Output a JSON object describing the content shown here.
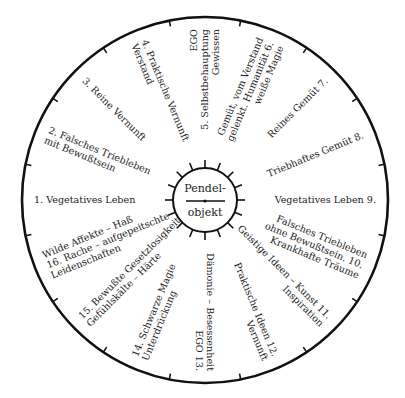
{
  "diagram": {
    "type": "radial-wheel",
    "center_label": [
      "Pendel-",
      "objekt"
    ],
    "segments": [
      {
        "num": "1.",
        "lines": [
          "1.  Vegetatives Leben"
        ],
        "angle": 180
      },
      {
        "num": "2.",
        "lines": [
          "2.  Falsches Triebleben",
          "mit Bewußtsein"
        ],
        "angle": 202.5
      },
      {
        "num": "3.",
        "lines": [
          "3.  Reine Vernunft"
        ],
        "angle": 225
      },
      {
        "num": "4.",
        "lines": [
          "4.  Praktische Vernunft",
          "Verstand"
        ],
        "angle": 247.5
      },
      {
        "num": "5.",
        "lines": [
          "EGO",
          "5.  Selbstbehauptung",
          "Gewissen"
        ],
        "angle": 270
      },
      {
        "num": "6.",
        "lines": [
          "Gemüt, vom Verstand",
          "gelenkt. Humanität  6.",
          "weiße Magie"
        ],
        "angle": 292.5
      },
      {
        "num": "7.",
        "lines": [
          "Reines Gemüt  7."
        ],
        "angle": 315
      },
      {
        "num": "8.",
        "lines": [
          "Triebhaftes Gemüt  8."
        ],
        "angle": 337.5
      },
      {
        "num": "9.",
        "lines": [
          "Vegetatives Leben  9."
        ],
        "angle": 0
      },
      {
        "num": "10.",
        "lines": [
          "Falsches Triebleben",
          "ohne Bewußtsein.  10.",
          "Krankhafte Träume"
        ],
        "angle": 22.5
      },
      {
        "num": "11.",
        "lines": [
          "Geistige Ideen – Kunst  11.",
          "Inspiration"
        ],
        "angle": 45
      },
      {
        "num": "12.",
        "lines": [
          "Praktische Ideen  12.",
          "Vernunft"
        ],
        "angle": 67.5
      },
      {
        "num": "13.",
        "lines": [
          "Dämonie – Besessenheit",
          "EGO  13."
        ],
        "angle": 90
      },
      {
        "num": "14.",
        "lines": [
          "14.  Schwarze Magie",
          "Unterdrückung"
        ],
        "angle": 112.5
      },
      {
        "num": "15.",
        "lines": [
          "15.  Bewußte Gesetzlosigkeit",
          "Gefühlskälte – Härte"
        ],
        "angle": 135
      },
      {
        "num": "16.",
        "lines": [
          "Wilde Affekte – Haß",
          "16.  Rache – aufgepeitschte",
          "Leidenschaften"
        ],
        "angle": 157.5
      }
    ]
  }
}
